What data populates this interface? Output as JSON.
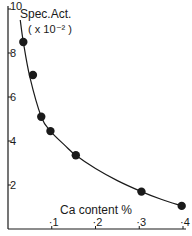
{
  "chart_data": {
    "type": "scatter",
    "title": "",
    "xlabel": "Ca content %",
    "ylabel": "Spec.Act.",
    "ylabel_scale": "( x 10⁻² )",
    "xlim": [
      0,
      0.41
    ],
    "ylim": [
      0,
      10
    ],
    "x_ticks": [
      0.1,
      0.2,
      0.3,
      0.4
    ],
    "x_tick_labels": [
      "·1",
      "·2",
      "·3",
      "·4"
    ],
    "y_ticks": [
      2,
      4,
      6,
      8,
      10
    ],
    "y_tick_labels": [
      "2",
      "4",
      "6",
      "8",
      "10"
    ],
    "grid": false,
    "legend": null,
    "series": [
      {
        "name": "measured",
        "marker": "filled-circle",
        "x": [
          0.035,
          0.057,
          0.076,
          0.097,
          0.155,
          0.305,
          0.397
        ],
        "y": [
          8.5,
          7.0,
          5.1,
          4.45,
          3.35,
          1.7,
          1.05
        ]
      },
      {
        "name": "fitted curve",
        "marker": "none",
        "line": "smooth",
        "x": [
          0.028,
          0.035,
          0.05,
          0.076,
          0.097,
          0.13,
          0.155,
          0.2,
          0.25,
          0.305,
          0.35,
          0.397
        ],
        "y": [
          9.5,
          8.5,
          6.9,
          5.1,
          4.45,
          3.8,
          3.35,
          2.75,
          2.2,
          1.7,
          1.35,
          1.05
        ]
      }
    ],
    "colors": {
      "ink": "#1a1a1a",
      "background": "#ffffff"
    }
  }
}
